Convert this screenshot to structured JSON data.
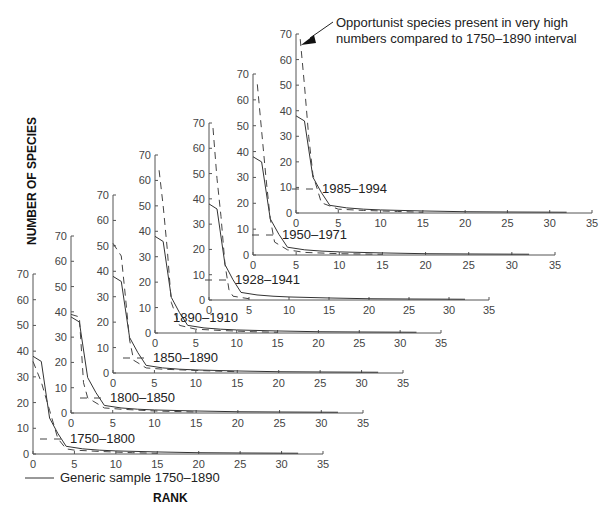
{
  "chart_data": {
    "type": "line",
    "layout": "stacked-offset-panels (7 rank-abundance plots arranged diagonally)",
    "xlabel": "RANK",
    "ylabel": "NUMBER OF SPECIES",
    "xlim": [
      0,
      35
    ],
    "ylim": [
      0,
      70
    ],
    "xticks": [
      0,
      5,
      10,
      15,
      20,
      25,
      30,
      35
    ],
    "yticks": [
      0,
      10,
      20,
      30,
      40,
      50,
      60,
      70
    ],
    "grid": false,
    "legend": {
      "solid_label": "Generic sample 1750–1890",
      "position": "bottom-left"
    },
    "annotation": {
      "text_line1": "Opportunist species present in very high",
      "text_line2": "numbers compared to 1750–1890 interval",
      "points_to_panel": "1985–1994",
      "arrow_target": [
        0.5,
        66
      ]
    },
    "generic_series": {
      "name": "Generic sample 1750–1890",
      "style": "solid",
      "x": [
        0,
        1,
        2,
        3,
        4,
        6,
        8,
        10,
        15,
        20,
        25,
        32
      ],
      "y": [
        38,
        36,
        14,
        8,
        3,
        2,
        1.5,
        1.2,
        0.8,
        0.5,
        0.4,
        0.3
      ]
    },
    "panels": [
      {
        "label": "1750–1800",
        "show_dash_marker": true,
        "series": {
          "name": "1750–1800",
          "style": "dashed",
          "x": [
            0,
            0.5,
            1,
            2,
            3,
            4,
            5,
            8,
            12,
            15
          ],
          "y": [
            36,
            32,
            28,
            17,
            6,
            2,
            1.5,
            1,
            0.5,
            0.3
          ]
        }
      },
      {
        "label": "1800–1850",
        "show_dash_marker": true,
        "series": {
          "name": "1800–1850",
          "style": "dashed",
          "x": [
            0,
            1,
            1.5,
            2,
            4,
            6,
            10,
            15
          ],
          "y": [
            39,
            38,
            12,
            6,
            2,
            1.5,
            0.8,
            0.4
          ]
        }
      },
      {
        "label": "1850–1890",
        "show_dash_marker": true,
        "series": {
          "name": "1850–1890",
          "style": "dashed",
          "x": [
            0,
            1,
            1.5,
            2,
            2.5,
            4,
            6,
            10,
            15
          ],
          "y": [
            51,
            46,
            30,
            13,
            5,
            2,
            1.5,
            1,
            0.5
          ]
        }
      },
      {
        "label": "1890–1910",
        "show_dash_marker": false,
        "series": {
          "name": "1890–1910",
          "style": "dashed",
          "x": [
            0.5,
            1,
            1.5,
            2,
            3,
            5,
            8,
            12,
            15
          ],
          "y": [
            64,
            50,
            33,
            12,
            3,
            1.5,
            1,
            0.5,
            0.3
          ]
        }
      },
      {
        "label": "1928–1941",
        "show_dash_marker": true,
        "series": {
          "name": "1928–1941",
          "style": "dashed",
          "x": [
            0.5,
            1,
            1.5,
            2,
            2.5,
            3,
            4,
            5
          ],
          "y": [
            68,
            48,
            33,
            14,
            4,
            1.5,
            1,
            0.5
          ]
        }
      },
      {
        "label": "1950–1971",
        "show_dash_marker": true,
        "series": {
          "name": "1950–1971",
          "style": "dashed",
          "x": [
            0.5,
            1,
            1.5,
            2,
            2.5,
            4,
            6,
            10,
            15
          ],
          "y": [
            66,
            48,
            30,
            14,
            5,
            2,
            1,
            0.5,
            0.3
          ]
        }
      },
      {
        "label": "1985–1994",
        "show_dash_marker": true,
        "series": {
          "name": "1985–1994",
          "style": "dashed",
          "x": [
            0.5,
            1,
            1.5,
            2,
            3,
            5,
            8,
            12,
            15
          ],
          "y": [
            68,
            50,
            30,
            15,
            4,
            1.5,
            1,
            0.6,
            0.3
          ]
        }
      }
    ]
  },
  "geometry": {
    "panels": [
      {
        "x0": 33,
        "y0": 454,
        "w": 290,
        "h": 180,
        "label_x": 70,
        "label_y": 443
      },
      {
        "x0": 71,
        "y0": 413,
        "w": 292,
        "h": 177,
        "label_x": 110,
        "label_y": 402
      },
      {
        "x0": 113,
        "y0": 373,
        "w": 290,
        "h": 178,
        "label_x": 153,
        "label_y": 362
      },
      {
        "x0": 155,
        "y0": 333,
        "w": 286,
        "h": 178,
        "label_x": 173,
        "label_y": 322
      },
      {
        "x0": 209,
        "y0": 300,
        "w": 280,
        "h": 177,
        "label_x": 235,
        "label_y": 284
      },
      {
        "x0": 253,
        "y0": 255,
        "w": 302,
        "h": 181,
        "label_x": 282,
        "label_y": 239
      },
      {
        "x0": 296,
        "y0": 213,
        "w": 296,
        "h": 179,
        "label_x": 322,
        "label_y": 193
      }
    ]
  }
}
